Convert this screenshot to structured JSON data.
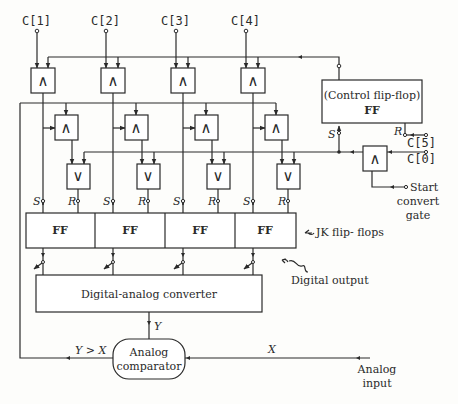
{
  "diagram": {
    "control_inputs": [
      "C[1]",
      "C[2]",
      "C[3]",
      "C[4]"
    ],
    "control_ff": {
      "line1": "(Control flip-flop)",
      "line2": "FF",
      "set_label": "S",
      "reset_label": "R"
    },
    "clock_inputs": {
      "c5": "C[5]",
      "c0": "C[0]"
    },
    "start_gate": {
      "line1": "Start",
      "line2": "convert",
      "line3": "gate"
    },
    "gates": {
      "and_symbol": "∧",
      "or_symbol": "∨"
    },
    "jk_flipflops": {
      "cells": [
        "FF",
        "FF",
        "FF",
        "FF"
      ],
      "set_label": "S",
      "reset_label": "R",
      "caption": "JK  flip- flops"
    },
    "digital_output_label": "Digital output",
    "dac": {
      "label": "Digital-analog converter",
      "output_label": "Y"
    },
    "comparator": {
      "line1": "Analog",
      "line2": "comparator",
      "output_label": "Y > X",
      "input_label": "X"
    },
    "analog_input": {
      "line1": "Analog",
      "line2": "input"
    }
  }
}
